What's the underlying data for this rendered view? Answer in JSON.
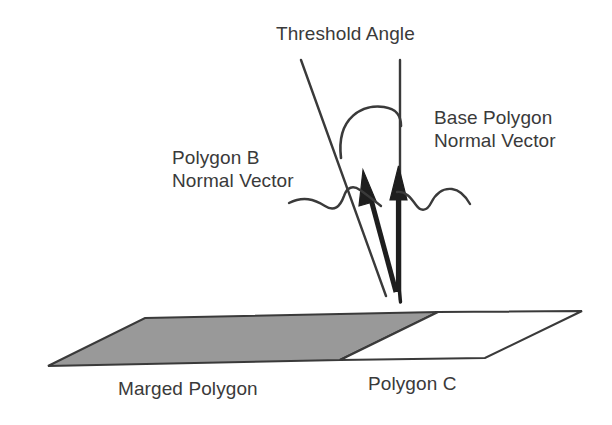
{
  "figure": {
    "title_text": "Threshold Angle",
    "background_color": "#ffffff",
    "ink_color": "#3a3a3a",
    "fill_gray": "#999999"
  },
  "labels": {
    "threshold_angle": "Threshold Angle",
    "base_polygon_normal_vector_line1": "Base Polygon",
    "base_polygon_normal_vector_line2": "Normal Vector",
    "polygon_b_normal_vector_line1": "Polygon B",
    "polygon_b_normal_vector_line2": "Normal Vector",
    "marged_polygon": "Marged Polygon",
    "polygon_c": "Polygon C"
  },
  "geometry": {
    "parallelogram": {
      "top_left": "145,318",
      "top_right": "582,311",
      "bottom_right": "485,358",
      "bottom_left": "48,366",
      "divider_top": "438,312",
      "divider_bottom": "340,360"
    },
    "vectors": {
      "origin": "398,292",
      "base_polygon_normal_tip": "399,168",
      "polygon_b_normal_tip": "364,172"
    }
  }
}
